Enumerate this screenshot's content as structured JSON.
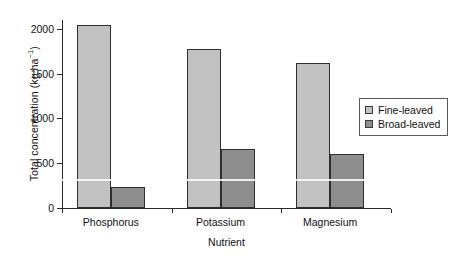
{
  "chart_data": {
    "type": "bar",
    "title": "",
    "subtitle": "",
    "xlabel": "Nutrient",
    "ylabel": "Total concentration (kg ha",
    "ylabel_superscript": "−1",
    "ylabel_suffix": ")",
    "categories": [
      "Phosphorus",
      "Potassium",
      "Magnesium"
    ],
    "series": [
      {
        "name": "Fine-leaved",
        "values": [
          2040,
          1780,
          1625
        ],
        "color": "#c2c2c2"
      },
      {
        "name": "Broad-leaved",
        "values": [
          235,
          655,
          605
        ],
        "color": "#8e8e8e"
      }
    ],
    "ylim": [
      0,
      2100
    ],
    "yticks": [
      0,
      500,
      1000,
      1500,
      2000
    ],
    "ytick_labels": [
      "0",
      "500",
      "1000",
      "1500",
      "2000"
    ],
    "grid": false,
    "legend_position": "right",
    "axis_color": "#2b2b2b",
    "bar_edge_color": "#2e2e2e",
    "background": "#ffffff"
  },
  "legend": {
    "entries": [
      {
        "label": "Fine-leaved",
        "swatch_color": "#c2c2c2"
      },
      {
        "label": "Broad-leaved",
        "swatch_color": "#8e8e8e"
      }
    ]
  }
}
